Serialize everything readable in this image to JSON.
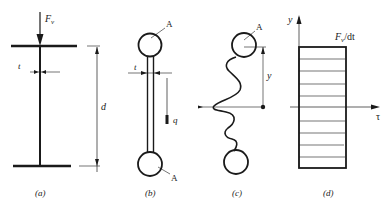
{
  "figure": {
    "panels": [
      {
        "id": "a",
        "caption": "(a)",
        "labels": {
          "force": "F",
          "force_sub": "v",
          "thickness": "t",
          "depth": "d"
        }
      },
      {
        "id": "b",
        "caption": "(b)",
        "labels": {
          "area_top": "A",
          "area_bottom": "A",
          "thickness": "t",
          "shear_flow": "q"
        }
      },
      {
        "id": "c",
        "caption": "(c)",
        "labels": {
          "area_top": "A",
          "distance": "y"
        }
      },
      {
        "id": "d",
        "caption": "(d)",
        "labels": {
          "y_axis": "y",
          "x_axis": "τ",
          "stress_main": "F",
          "stress_sub": "v",
          "stress_rest": "/dt"
        }
      }
    ],
    "colors": {
      "ink": "#1a1a1a",
      "background": "#ffffff"
    }
  }
}
